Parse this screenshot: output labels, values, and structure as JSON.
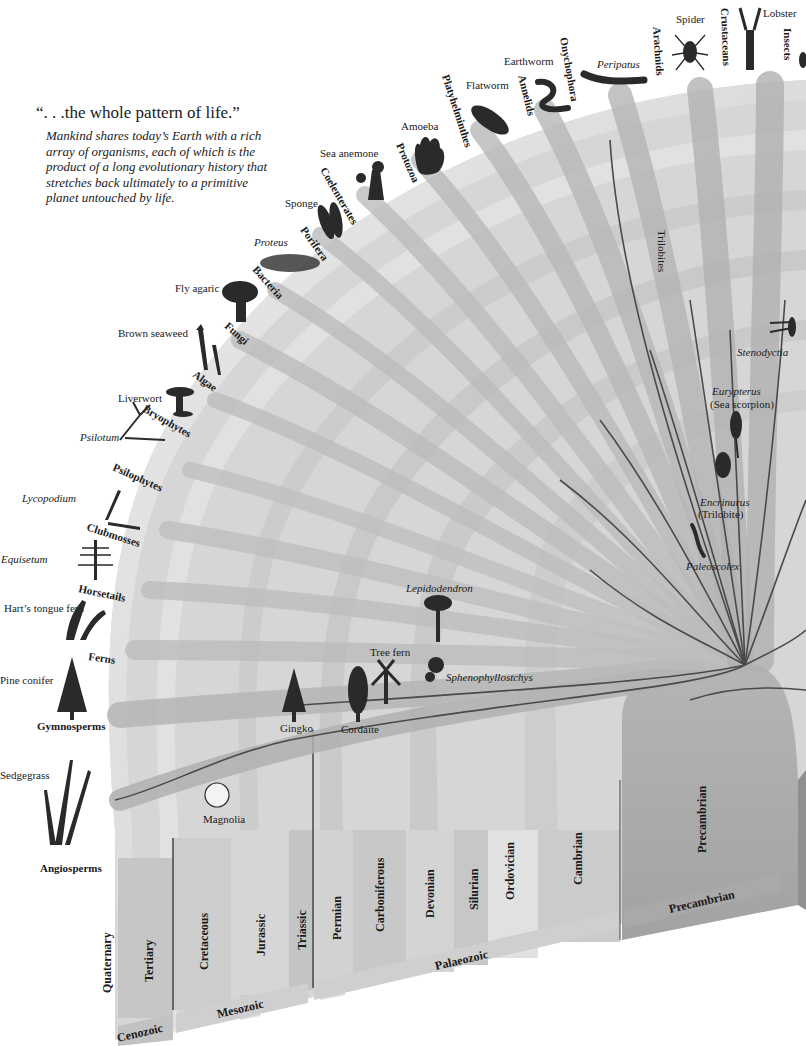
{
  "header": {
    "quote": "“. . .the whole pattern of life.”",
    "intro": "Mankind shares today’s Earth with a rich array of organisms, each of which is the product of a long evolutionary history that stretches back ultimately to a primitive planet untouched by life."
  },
  "groups": [
    {
      "name": "Angiosperms",
      "example": "Sedgegrass"
    },
    {
      "name": "Gymnosperms",
      "example": "Pine conifer"
    },
    {
      "name": "Ferns",
      "example": "Hart’s tongue fern"
    },
    {
      "name": "Horsetails",
      "example": "Equisetum"
    },
    {
      "name": "Clubmosses",
      "example": "Lycopodium"
    },
    {
      "name": "Psilophytes",
      "example": "Psilotum"
    },
    {
      "name": "Bryophytes",
      "example": "Liverwort"
    },
    {
      "name": "Algae",
      "example": "Brown seaweed"
    },
    {
      "name": "Fungi",
      "example": "Fly agaric"
    },
    {
      "name": "Bacteria",
      "example": "Proteus"
    },
    {
      "name": "Porifera",
      "example": "Sponge"
    },
    {
      "name": "Coelenterates",
      "example": "Sea anemone"
    },
    {
      "name": "Protozoa",
      "example": "Amoeba"
    },
    {
      "name": "Platyhelminthes",
      "example": "Flatworm"
    },
    {
      "name": "Annelids",
      "example": "Earthworm"
    },
    {
      "name": "Onychophora",
      "example": "Peripatus"
    },
    {
      "name": "Arachnids",
      "example": "Spider"
    },
    {
      "name": "Crustaceans",
      "example": "Lobster"
    },
    {
      "name": "Insects",
      "example": ""
    }
  ],
  "fossils": {
    "magnolia": "Magnolia",
    "gingko": "Gingko",
    "cordaite": "Cordaite",
    "tree_fern": "Tree fern",
    "lepidodendron": "Lepidodendron",
    "sphenophyllostchys": "Sphenophyllostchys",
    "trilobites": "Trilobites",
    "stenodyctia": "Stenodyctia",
    "eurypterus": "Eurypterus",
    "eurypterus_note": "(Sea scorpion)",
    "encrinurus": "Encrinurus",
    "encrinurus_note": "(Trilobite)",
    "paleoscolex": "Paleoscolex"
  },
  "periods": [
    "Quaternary",
    "Tertiary",
    "Cretaceous",
    "Jurassic",
    "Triassic",
    "Permian",
    "Carboniferous",
    "Devonian",
    "Silurian",
    "Ordovician",
    "Cambrian",
    "Precambrian"
  ],
  "eras": {
    "cenozoic": "Cenozoic",
    "mesozoic": "Mesozoic",
    "palaeozoic": "Palaeozoic",
    "precambrian": "Precambrian"
  },
  "colors": {
    "band_light": "#e4e4e4",
    "band_mid": "#cfcfcf",
    "band_dark": "#b9b9b9",
    "precambrian": "#a8a8a8",
    "rim": "#dadada",
    "line": "#4a4a4a"
  }
}
